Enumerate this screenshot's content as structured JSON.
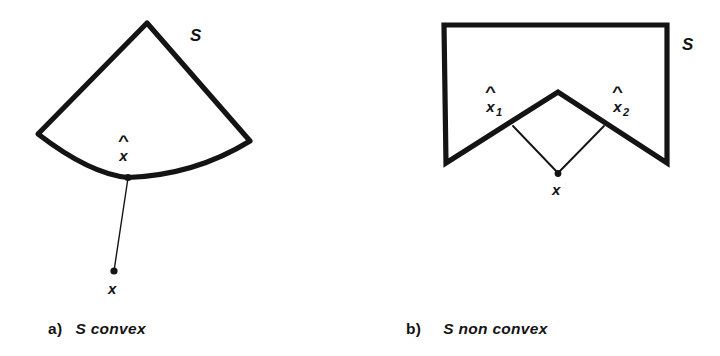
{
  "figure": {
    "background_color": "#ffffff",
    "ink_color": "#141414",
    "panels": [
      {
        "id": "a",
        "caption_tag": "a)",
        "caption_text": "S convex",
        "set_label": "S",
        "set_label_pos": {
          "x": 196,
          "y": 35
        },
        "shape_description": "convex fan / circular sector with straight apex sides and a bottom arc bulging downward",
        "shape_vertices": [
          {
            "name": "apex",
            "x": 147,
            "y": 23
          },
          {
            "name": "left-corner",
            "x": 38,
            "y": 134
          },
          {
            "name": "bottom-arc-point",
            "x": 128,
            "y": 177
          },
          {
            "name": "right-corner",
            "x": 250,
            "y": 141
          }
        ],
        "projection_point": {
          "label_base": "x",
          "label_hat": "^",
          "dot_x": 128,
          "dot_y": 177,
          "label_x": 128,
          "label_y": 149
        },
        "external_point": {
          "label": "x",
          "dot_x": 114,
          "dot_y": 272,
          "label_x": 114,
          "label_y": 290
        },
        "connector": {
          "from_x": 128,
          "from_y": 177,
          "to_x": 114,
          "to_y": 272,
          "style": "thin solid line"
        }
      },
      {
        "id": "b",
        "caption_tag": "b)",
        "caption_text": "S non convex",
        "set_label": "S",
        "set_label_pos": {
          "x": 688,
          "y": 44
        },
        "shape_description": "rectangle with a large V notch cut into the bottom edge creating a non-convex region",
        "shape_vertices": [
          {
            "name": "top-left",
            "x": 444,
            "y": 25
          },
          {
            "name": "top-right",
            "x": 667,
            "y": 25
          },
          {
            "name": "bottom-right",
            "x": 667,
            "y": 163
          },
          {
            "name": "notch-apex",
            "x": 558,
            "y": 92
          },
          {
            "name": "bottom-left",
            "x": 446,
            "y": 163
          }
        ],
        "projection_points": [
          {
            "label_base": "x",
            "label_hat": "^",
            "label_sub": "1",
            "dot_x": 513,
            "dot_y": 125,
            "label_x": 495,
            "label_y": 101
          },
          {
            "label_base": "x",
            "label_hat": "^",
            "label_sub": "2",
            "dot_x": 604,
            "dot_y": 125,
            "label_x": 622,
            "label_y": 101
          }
        ],
        "external_point": {
          "label": "x",
          "dot_x": 558,
          "dot_y": 174,
          "label_x": 558,
          "label_y": 191
        },
        "connectors": [
          {
            "from_x": 513,
            "from_y": 125,
            "to_x": 558,
            "to_y": 174,
            "style": "thin solid line"
          },
          {
            "from_x": 604,
            "from_y": 125,
            "to_x": 558,
            "to_y": 174,
            "style": "thin solid line"
          }
        ]
      }
    ]
  }
}
